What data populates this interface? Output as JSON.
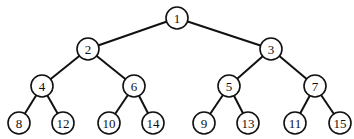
{
  "diagram": {
    "type": "binary-tree",
    "node_radius": 11,
    "colors": {
      "stroke": "#111111",
      "fill": "#ffffff",
      "background": "#ffffff"
    },
    "nodes": [
      {
        "id": "n1",
        "label": "1",
        "x": 177,
        "y": 18
      },
      {
        "id": "n2",
        "label": "2",
        "x": 88,
        "y": 49
      },
      {
        "id": "n3",
        "label": "3",
        "x": 271,
        "y": 49
      },
      {
        "id": "n4",
        "label": "4",
        "x": 42,
        "y": 86
      },
      {
        "id": "n6",
        "label": "6",
        "x": 134,
        "y": 86
      },
      {
        "id": "n5",
        "label": "5",
        "x": 229,
        "y": 86
      },
      {
        "id": "n7",
        "label": "7",
        "x": 315,
        "y": 86
      },
      {
        "id": "n8",
        "label": "8",
        "x": 19,
        "y": 123
      },
      {
        "id": "n12",
        "label": "12",
        "x": 63,
        "y": 123
      },
      {
        "id": "n10",
        "label": "10",
        "x": 109,
        "y": 123
      },
      {
        "id": "n14",
        "label": "14",
        "x": 153,
        "y": 123
      },
      {
        "id": "n9",
        "label": "9",
        "x": 204,
        "y": 123
      },
      {
        "id": "n13",
        "label": "13",
        "x": 248,
        "y": 123
      },
      {
        "id": "n11",
        "label": "11",
        "x": 295,
        "y": 123
      },
      {
        "id": "n15",
        "label": "15",
        "x": 340,
        "y": 123
      }
    ],
    "edges": [
      [
        "n1",
        "n2"
      ],
      [
        "n1",
        "n3"
      ],
      [
        "n2",
        "n4"
      ],
      [
        "n2",
        "n6"
      ],
      [
        "n3",
        "n5"
      ],
      [
        "n3",
        "n7"
      ],
      [
        "n4",
        "n8"
      ],
      [
        "n4",
        "n12"
      ],
      [
        "n6",
        "n10"
      ],
      [
        "n6",
        "n14"
      ],
      [
        "n5",
        "n9"
      ],
      [
        "n5",
        "n13"
      ],
      [
        "n7",
        "n11"
      ],
      [
        "n7",
        "n15"
      ]
    ]
  }
}
